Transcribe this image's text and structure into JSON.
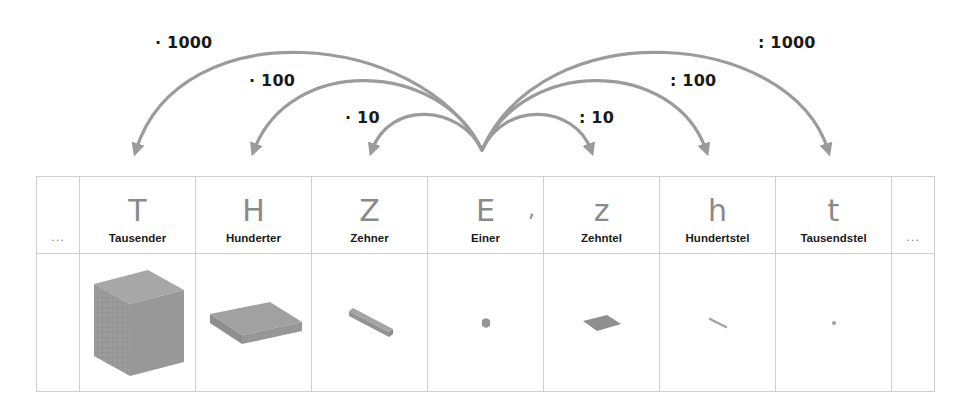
{
  "diagram": {
    "colors": {
      "arrow": "#9b9b9b",
      "block": "#9a9a9a",
      "grid": "#cfcfcf",
      "letter": "#8a8a8a",
      "text": "#1a1a1a"
    },
    "operations": {
      "multiply": [
        {
          "label": "· 1000",
          "target": "T"
        },
        {
          "label": "· 100",
          "target": "H"
        },
        {
          "label": "· 10",
          "target": "Z"
        }
      ],
      "divide": [
        {
          "label": ": 10",
          "target": "z"
        },
        {
          "label": ": 100",
          "target": "h"
        },
        {
          "label": ": 1000",
          "target": "t"
        }
      ]
    },
    "table": {
      "left_ellipsis": "...",
      "right_ellipsis": "...",
      "decimal_separator": ",",
      "columns": [
        {
          "letter": "T",
          "name": "Tausender",
          "block": "cube"
        },
        {
          "letter": "H",
          "name": "Hunderter",
          "block": "plate"
        },
        {
          "letter": "Z",
          "name": "Zehner",
          "block": "rod"
        },
        {
          "letter": "E",
          "name": "Einer",
          "block": "unit"
        },
        {
          "letter": "z",
          "name": "Zehntel",
          "block": "small-plate"
        },
        {
          "letter": "h",
          "name": "Hundertstel",
          "block": "small-rod"
        },
        {
          "letter": "t",
          "name": "Tausendstel",
          "block": "dot"
        }
      ]
    }
  }
}
